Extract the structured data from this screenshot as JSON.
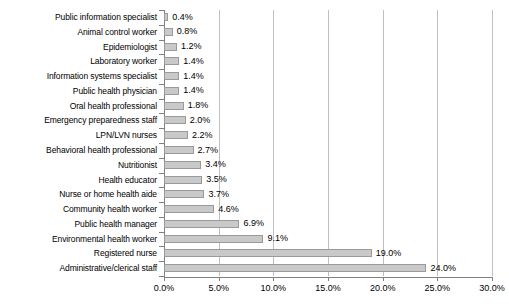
{
  "chart_data": {
    "type": "bar",
    "orientation": "horizontal",
    "title": "",
    "xlabel": "",
    "ylabel": "",
    "xlim": [
      0,
      30
    ],
    "xticks": [
      0,
      5,
      10,
      15,
      20,
      25,
      30
    ],
    "xtick_labels": [
      "0.0%",
      "5.0%",
      "10.0%",
      "15.0%",
      "20.0%",
      "25.0%",
      "30.0%"
    ],
    "grid": true,
    "legend": false,
    "bar_color": "#c9c9c9",
    "bar_border_color": "#9a9a9a",
    "gridline_color": "#bfbfbf",
    "axis_color": "#808080",
    "categories": [
      "Public information specialist",
      "Animal control worker",
      "Epidemiologist",
      "Laboratory worker",
      "Information systems specialist",
      "Public health physician",
      "Oral health professional",
      "Emergency preparedness staff",
      "LPN/LVN nurses",
      "Behavioral health professional",
      "Nutritionist",
      "Health educator",
      "Nurse or home health aide",
      "Community health worker",
      "Public health manager",
      "Environmental health worker",
      "Registered nurse",
      "Administrative/clerical staff"
    ],
    "values": [
      0.4,
      0.8,
      1.2,
      1.4,
      1.4,
      1.4,
      1.8,
      2.0,
      2.2,
      2.7,
      3.4,
      3.5,
      3.7,
      4.6,
      6.9,
      9.1,
      19.0,
      24.0
    ],
    "data_labels": [
      "0.4%",
      "0.8%",
      "1.2%",
      "1.4%",
      "1.4%",
      "1.4%",
      "1.8%",
      "2.0%",
      "2.2%",
      "2.7%",
      "3.4%",
      "3.5%",
      "3.7%",
      "4.6%",
      "6.9%",
      "9.1%",
      "19.0%",
      "24.0%"
    ]
  }
}
